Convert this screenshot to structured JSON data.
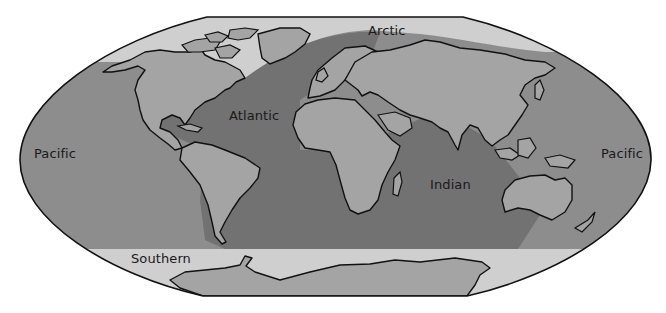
{
  "map": {
    "projection": "world map",
    "colors": {
      "pacific": "#8d8d8d",
      "atlantic_indian": "#727272",
      "polar": "#cfcfcf",
      "land": "#a4a4a4",
      "outline": "#111111",
      "background": "#ffffff"
    },
    "labels": {
      "arctic": "Arctic",
      "atlantic": "Atlantic",
      "pacific_west": "Pacific",
      "pacific_east": "Pacific",
      "indian": "Indian",
      "southern": "Southern"
    }
  }
}
